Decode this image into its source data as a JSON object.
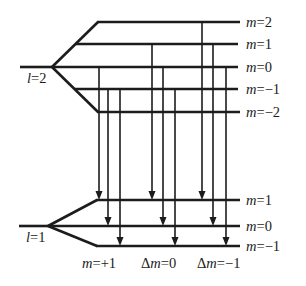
{
  "diagram": {
    "title": "",
    "upper_level": {
      "label_var": "l",
      "label_value": "=2",
      "sublevels": [
        {
          "var": "m",
          "value": "=2"
        },
        {
          "var": "m",
          "value": "=1"
        },
        {
          "var": "m",
          "value": "=0"
        },
        {
          "var": "m",
          "value": "=−1"
        },
        {
          "var": "m",
          "value": "=−2"
        }
      ]
    },
    "lower_level": {
      "label_var": "l",
      "label_value": "=1",
      "sublevels": [
        {
          "var": "m",
          "value": "=1"
        },
        {
          "var": "m",
          "value": "=0"
        },
        {
          "var": "m",
          "value": "=−1"
        }
      ]
    },
    "transition_groups": [
      {
        "delta": "",
        "var": "m",
        "value": "=+1",
        "transitions": [
          {
            "from_m": 0,
            "to_m": 1
          },
          {
            "from_m": -1,
            "to_m": 0
          },
          {
            "from_m": -1,
            "to_m": -1
          }
        ]
      },
      {
        "delta": "Δ",
        "var": "m",
        "value": "=0",
        "transitions": [
          {
            "from_m": 1,
            "to_m": 1
          },
          {
            "from_m": 0,
            "to_m": 0
          },
          {
            "from_m": -1,
            "to_m": -1
          }
        ]
      },
      {
        "delta": "Δ",
        "var": "m",
        "value": "=−1",
        "transitions": [
          {
            "from_m": 2,
            "to_m": 1
          },
          {
            "from_m": 1,
            "to_m": 0
          },
          {
            "from_m": 0,
            "to_m": -1
          }
        ]
      }
    ],
    "colors": {
      "line": "#1c1c1c",
      "background": "#ffffff"
    }
  }
}
